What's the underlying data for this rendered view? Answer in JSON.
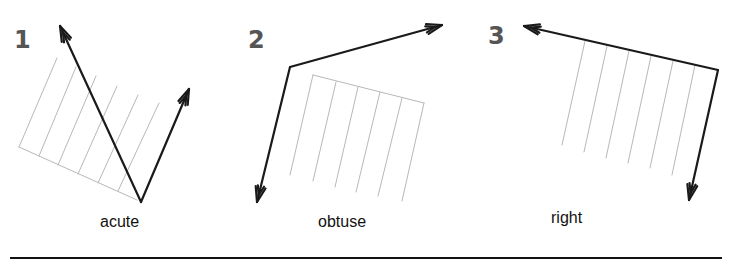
{
  "figure": {
    "panels": [
      {
        "number": "1",
        "label": "acute",
        "number_pos": [
          14,
          28
        ],
        "label_pos": [
          100,
          214
        ],
        "apex": [
          141,
          202
        ],
        "arrows": [
          [
            60,
            26
          ],
          [
            189,
            89
          ]
        ],
        "hatch": {
          "base": [
            [
              19,
              147
            ],
            [
              137,
              200
            ]
          ],
          "lines": [
            [
              [
                19,
                147
              ],
              [
                57,
                58
              ]
            ],
            [
              [
                39,
                156
              ],
              [
                76,
                67
              ]
            ],
            [
              [
                58,
                165
              ],
              [
                96,
                76
              ]
            ],
            [
              [
                78,
                174
              ],
              [
                117,
                86
              ]
            ],
            [
              [
                98,
                183
              ],
              [
                138,
                95
              ]
            ],
            [
              [
                118,
                191
              ],
              [
                159,
                103
              ]
            ]
          ]
        }
      },
      {
        "number": "2",
        "label": "obtuse",
        "number_pos": [
          248,
          28
        ],
        "label_pos": [
          318,
          214
        ],
        "apex": [
          290,
          67
        ],
        "arrows": [
          [
            442,
            25
          ],
          [
            257,
            202
          ]
        ],
        "hatch": {
          "base": [
            [
              313,
              75
            ],
            [
              424,
              103
            ]
          ],
          "lines": [
            [
              [
                313,
                75
              ],
              [
                290,
                175
              ]
            ],
            [
              [
                336,
                82
              ],
              [
                313,
                181
              ]
            ],
            [
              [
                358,
                87
              ],
              [
                335,
                187
              ]
            ],
            [
              [
                380,
                92
              ],
              [
                356,
                192
              ]
            ],
            [
              [
                402,
                98
              ],
              [
                378,
                196
              ]
            ],
            [
              [
                424,
                103
              ],
              [
                402,
                201
              ]
            ]
          ]
        }
      },
      {
        "number": "3",
        "label": "right",
        "number_pos": [
          488,
          24
        ],
        "label_pos": [
          551,
          210
        ],
        "apex": [
          718,
          70
        ],
        "arrows": [
          [
            524,
            26
          ],
          [
            689,
            200
          ]
        ],
        "hatch": {
          "base": null,
          "lines": [
            [
              [
                585,
                41
              ],
              [
                562,
                145
              ]
            ],
            [
              [
                607,
                46
              ],
              [
                584,
                152
              ]
            ],
            [
              [
                629,
                51
              ],
              [
                606,
                158
              ]
            ],
            [
              [
                651,
                56
              ],
              [
                628,
                163
              ]
            ],
            [
              [
                673,
                61
              ],
              [
                650,
                168
              ]
            ],
            [
              [
                695,
                65
              ],
              [
                672,
                175
              ]
            ]
          ]
        }
      }
    ],
    "colors": {
      "arrow": "#1a1a1a",
      "hatch": "#b8b8b8",
      "number": "#555555",
      "rule": "#111111"
    }
  }
}
